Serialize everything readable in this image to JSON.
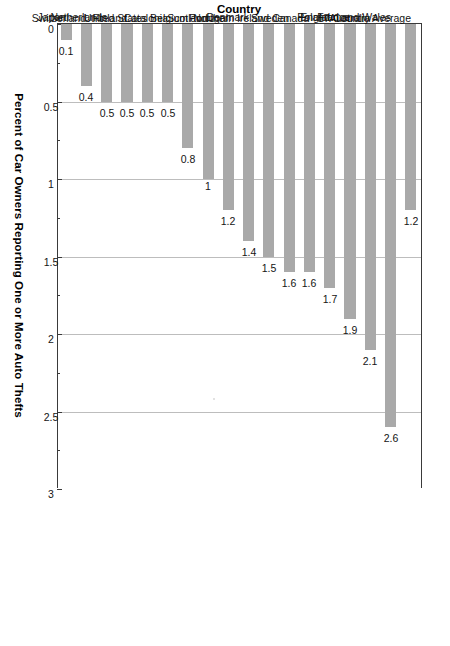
{
  "chart_data": {
    "type": "bar",
    "orientation": "vertical-rotated",
    "title": "",
    "xlabel": "Country",
    "ylabel": "Percent of Car Owners Reporting One or More Auto Thefts",
    "ylim": [
      0,
      3
    ],
    "yticks": [
      0,
      0.5,
      1,
      1.5,
      2,
      2.5,
      3
    ],
    "ytick_labels": [
      "0",
      "0.5",
      "1",
      "1.5",
      "2",
      "2.5",
      "3"
    ],
    "minor_tick_step": 0.25,
    "grid": true,
    "grid_axis": "value",
    "legend": null,
    "bar_color": "#a9a9a9",
    "axis_color": "#3a3a3a",
    "grid_color": "#c9c9c9",
    "categories": [
      "17-Country Average",
      "England and Wales",
      "Australia",
      "France",
      "Poland",
      "Canada",
      "Sweden",
      "Northern Ireland",
      "Denmark",
      "Portugal",
      "Scotland",
      "Belgium",
      "Catalonia",
      "United States",
      "Finland",
      "Netherlands",
      "Switzerland",
      "Japan"
    ],
    "values": [
      1.2,
      2.6,
      2.1,
      1.9,
      1.7,
      1.6,
      1.6,
      1.5,
      1.4,
      1.2,
      1,
      0.8,
      0.5,
      0.5,
      0.5,
      0.5,
      0.4,
      0.1
    ],
    "value_labels": [
      "1.2",
      "2.6",
      "2.1",
      "1.9",
      "1.7",
      "1.6",
      "1.6",
      "1.5",
      "1.4",
      "1.2",
      "1",
      "0.8",
      "0.5",
      "0.5",
      "0.5",
      "0.5",
      "0.4",
      "0.1"
    ]
  },
  "axes": {
    "value_axis_title": "Percent of Car Owners Reporting One or More Auto Thefts",
    "category_axis_title": "Country"
  }
}
